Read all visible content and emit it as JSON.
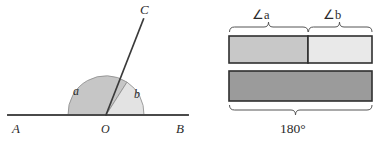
{
  "figure": {
    "title_text": "",
    "colors": {
      "stroke": "#3a3a3a",
      "text": "#2b2b2b",
      "angle_a_fill": "#c6c6c6",
      "angle_b_fill": "#e3e3e3",
      "bar_a_fill": "#c8c8c8",
      "bar_b_fill": "#e9e9e9",
      "bar_total_fill": "#9b9b9b",
      "background": "#ffffff"
    }
  },
  "angle_diagram": {
    "point_a_label": "A",
    "point_b_label": "B",
    "point_c_label": "C",
    "vertex_label": "O",
    "angle_a_label": "a",
    "angle_b_label": "b"
  },
  "bar_diagram": {
    "brace_a_label": "∠a",
    "brace_b_label": "∠b",
    "total_label": "180°"
  }
}
